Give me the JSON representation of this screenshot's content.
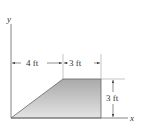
{
  "figure": {
    "axes": {
      "x_label": "x",
      "y_label": "y"
    },
    "dimensions": {
      "horizontal_left": "4 ft",
      "horizontal_right": "3 ft",
      "vertical_right": "3 ft"
    },
    "shape": {
      "type": "trapezoid",
      "vertices_ft": [
        [
          0,
          0
        ],
        [
          4,
          3
        ],
        [
          7,
          3
        ],
        [
          7,
          0
        ]
      ],
      "fill_color": "#b8b8b8"
    },
    "colors": {
      "line": "#555555",
      "text": "#333333"
    }
  }
}
